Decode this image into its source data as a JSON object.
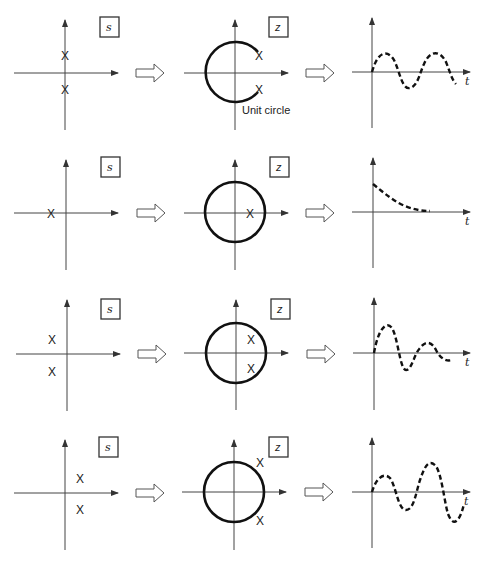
{
  "labels": {
    "s_plane": "s",
    "z_plane": "z",
    "time_axis": "t",
    "unit_circle": "Unit circle",
    "pole_marker": "X"
  },
  "rows": [
    {
      "id": "oscillatory",
      "s_poles": "on imaginary axis (conjugate pair)",
      "z_poles": "on unit circle (conjugate pair)",
      "response": "sustained oscillation"
    },
    {
      "id": "decaying",
      "s_poles": "on negative real axis",
      "z_poles": "on positive real axis inside unit circle",
      "response": "exponential decay"
    },
    {
      "id": "damped",
      "s_poles": "left half-plane (conjugate pair)",
      "z_poles": "inside unit circle (conjugate pair)",
      "response": "damped oscillation"
    },
    {
      "id": "growing",
      "s_poles": "right half-plane (conjugate pair)",
      "z_poles": "outside unit circle (conjugate pair)",
      "response": "growing oscillation"
    }
  ]
}
